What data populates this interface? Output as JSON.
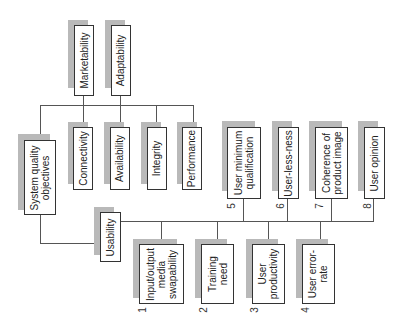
{
  "diagram": {
    "type": "hierarchy-tree",
    "root": "System quality objectives",
    "top_group": {
      "items": [
        {
          "label": "Marketability"
        },
        {
          "label": "Adaptability"
        },
        {
          "label": "Connectivity"
        },
        {
          "label": "Availability"
        },
        {
          "label": "Integrity"
        },
        {
          "label": "Performance"
        }
      ]
    },
    "usability": {
      "label": "Usability",
      "children": [
        {
          "num": "1",
          "label": "Input/output\nmedia\nswapability"
        },
        {
          "num": "2",
          "label": "Training\nneed"
        },
        {
          "num": "3",
          "label": "User\nproductivity"
        },
        {
          "num": "4",
          "label": "User error-\nrate"
        },
        {
          "num": "5",
          "label": "User minimum\nqualification"
        },
        {
          "num": "6",
          "label": "User-less-ness"
        },
        {
          "num": "7",
          "label": "Coherence of\nproduct image"
        },
        {
          "num": "8",
          "label": "User opinion"
        }
      ]
    },
    "root_box": {
      "label": "System quality\nobjectives"
    }
  }
}
